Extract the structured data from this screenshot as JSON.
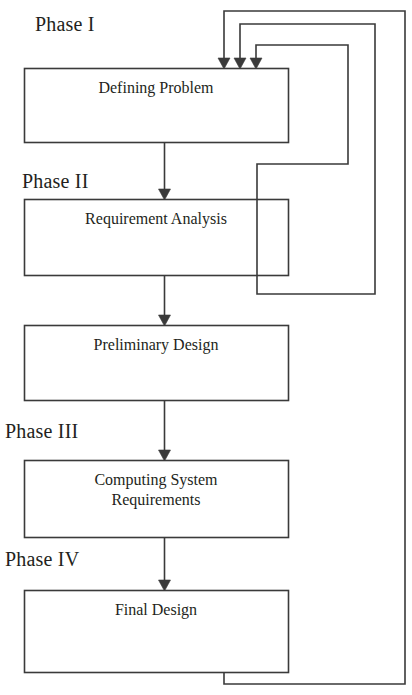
{
  "diagram": {
    "stroke_color": "#3a3a3a",
    "text_color": "#231f20",
    "background_color": "#ffffff",
    "phases": [
      {
        "id": "phase-1",
        "label": "Phase I",
        "x": 35,
        "y": 13
      },
      {
        "id": "phase-2",
        "label": "Phase II",
        "x": 22,
        "y": 170
      },
      {
        "id": "phase-3",
        "label": "Phase III",
        "x": 5,
        "y": 420
      },
      {
        "id": "phase-4",
        "label": "Phase IV",
        "x": 5,
        "y": 548
      }
    ],
    "boxes": [
      {
        "id": "defining-problem",
        "label": "Defining Problem",
        "x": 24,
        "y": 68,
        "w": 264,
        "h": 74,
        "label_y": 78
      },
      {
        "id": "requirement-analysis",
        "label": "Requirement Analysis",
        "x": 24,
        "y": 199,
        "w": 264,
        "h": 76,
        "label_y": 209
      },
      {
        "id": "preliminary-design",
        "label": "Preliminary Design",
        "x": 24,
        "y": 325,
        "w": 264,
        "h": 75,
        "label_y": 335
      },
      {
        "id": "computing-system-requirements",
        "label": "Computing System\nRequirements",
        "x": 24,
        "y": 460,
        "w": 264,
        "h": 77,
        "label_y": 470
      },
      {
        "id": "final-design",
        "label": "Final Design",
        "x": 24,
        "y": 590,
        "w": 264,
        "h": 82,
        "label_y": 600
      }
    ],
    "forward_arrows": [
      {
        "id": "arrow-problem-to-requirement",
        "from": "defining-problem",
        "to": "requirement-analysis",
        "x": 164,
        "y1": 142,
        "y2": 199
      },
      {
        "id": "arrow-requirement-to-preliminary",
        "from": "requirement-analysis",
        "to": "preliminary-design",
        "x": 164,
        "y1": 275,
        "y2": 325
      },
      {
        "id": "arrow-preliminary-to-computing",
        "from": "preliminary-design",
        "to": "computing-system-requirements",
        "x": 164,
        "y1": 400,
        "y2": 460
      },
      {
        "id": "arrow-computing-to-final",
        "from": "computing-system-requirements",
        "to": "final-design",
        "x": 164,
        "y1": 537,
        "y2": 590
      }
    ],
    "feedback_loops": [
      {
        "id": "feedback-inner",
        "from": "requirement-analysis",
        "to": "defining-problem",
        "path": "M 257 275 L 257 164 L 348 164 L 348 45 L 256 45 L 256 62",
        "arrow_x": 256,
        "arrow_y": 62
      },
      {
        "id": "feedback-middle",
        "from": "preliminary-design",
        "to": "defining-problem",
        "path": "M 257 275 L 257 294 L 375 294 L 375 24 L 240 24 L 240 62",
        "arrow_x": 240,
        "arrow_y": 62
      },
      {
        "id": "feedback-outer",
        "from": "final-design",
        "to": "defining-problem",
        "path": "M 224 672 L 224 684 L 405 684 L 405 11 L 224 11 L 224 62",
        "arrow_x": 224,
        "arrow_y": 62
      }
    ]
  }
}
